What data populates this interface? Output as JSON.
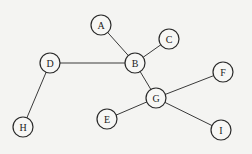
{
  "diagram": {
    "type": "undirected-graph",
    "node_radius": 10,
    "colors": {
      "background": "#f4f4f2",
      "stroke": "#2a2a2a",
      "node_fill": "#f7f7f5",
      "text": "#222222"
    },
    "nodes": [
      {
        "id": "A",
        "label": "A",
        "x": 101,
        "y": 25
      },
      {
        "id": "B",
        "label": "B",
        "x": 135,
        "y": 63
      },
      {
        "id": "C",
        "label": "C",
        "x": 169,
        "y": 39
      },
      {
        "id": "D",
        "label": "D",
        "x": 50,
        "y": 63
      },
      {
        "id": "E",
        "label": "E",
        "x": 107,
        "y": 119
      },
      {
        "id": "F",
        "label": "F",
        "x": 223,
        "y": 72
      },
      {
        "id": "G",
        "label": "G",
        "x": 156,
        "y": 98
      },
      {
        "id": "H",
        "label": "H",
        "x": 23,
        "y": 127
      },
      {
        "id": "I",
        "label": "I",
        "x": 221,
        "y": 130
      }
    ],
    "edges": [
      {
        "from": "D",
        "to": "B"
      },
      {
        "from": "D",
        "to": "H"
      },
      {
        "from": "A",
        "to": "B"
      },
      {
        "from": "C",
        "to": "B"
      },
      {
        "from": "B",
        "to": "G"
      },
      {
        "from": "G",
        "to": "F"
      },
      {
        "from": "G",
        "to": "E"
      },
      {
        "from": "G",
        "to": "I"
      }
    ]
  }
}
